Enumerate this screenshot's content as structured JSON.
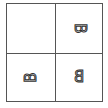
{
  "grid": {
    "rows": 2,
    "cols": 2,
    "border_color": "#555555",
    "cells": [
      {
        "position": "top-left",
        "letter": "",
        "transform": "none"
      },
      {
        "position": "top-right",
        "letter": "B",
        "transform": "rotate-90-cw"
      },
      {
        "position": "bottom-left",
        "letter": "B",
        "transform": "rotate-90-ccw"
      },
      {
        "position": "bottom-right",
        "letter": "B",
        "transform": "mirror-horizontal"
      }
    ]
  }
}
